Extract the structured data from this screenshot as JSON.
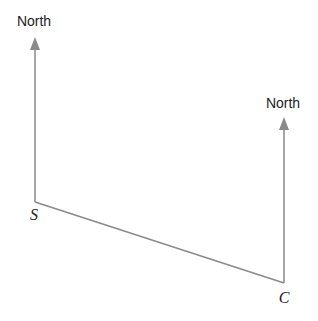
{
  "diagram": {
    "left_north_label": "North",
    "right_north_label": "North",
    "point_s": "S",
    "point_c": "C",
    "line_color": "#8a8a8a"
  }
}
